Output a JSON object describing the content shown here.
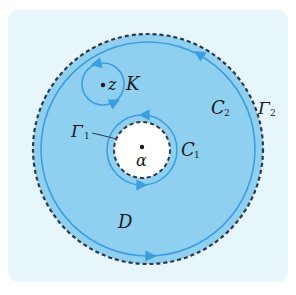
{
  "diagram": {
    "title": "",
    "colors": {
      "panel_bg": "#e6f6fb",
      "region_fill": "#8fd0f0",
      "contour_stroke": "#3a9ee0",
      "dashed_stroke": "#2a3a4a",
      "hole_fill": "#ffffff",
      "text": "#1a1a1a"
    },
    "labels": {
      "region": "D",
      "small_circle": "K",
      "point_z": "z",
      "point_alpha": "α",
      "inner_contour_main": "C",
      "inner_contour_sub": "1",
      "outer_contour_main": "C",
      "outer_contour_sub": "2",
      "inner_boundary_main": "Γ",
      "inner_boundary_sub": "1",
      "outer_boundary_main": "Γ",
      "outer_boundary_sub": "2"
    },
    "elements": [
      {
        "name": "outer-boundary-Γ2",
        "type": "dashed-circle",
        "cx": 148,
        "cy": 149,
        "r": 115
      },
      {
        "name": "contour-C2",
        "type": "solid-circle",
        "cx": 148,
        "cy": 149,
        "r": 107,
        "orientation": "counterclockwise"
      },
      {
        "name": "inner-boundary-Γ1",
        "type": "dashed-circle",
        "cx": 142,
        "cy": 150,
        "r": 28
      },
      {
        "name": "contour-C1",
        "type": "solid-circle",
        "cx": 142,
        "cy": 150,
        "r": 35,
        "orientation": "clockwise"
      },
      {
        "name": "circle-K",
        "type": "solid-circle",
        "cx": 103,
        "cy": 83,
        "r": 21,
        "orientation": "counterclockwise"
      },
      {
        "name": "point-z",
        "type": "point",
        "x": 103,
        "y": 84
      },
      {
        "name": "point-alpha",
        "type": "point",
        "x": 142,
        "y": 147
      }
    ]
  }
}
